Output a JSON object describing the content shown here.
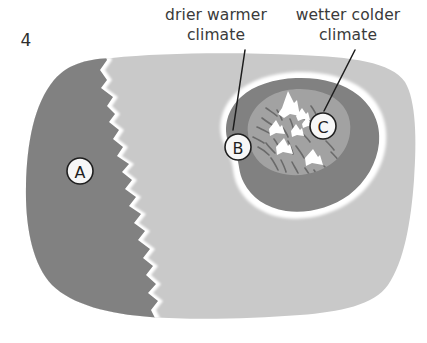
{
  "figure": {
    "number": "4",
    "title_visible": false
  },
  "callouts": [
    {
      "id": "drier-warmer",
      "line1": "drier warmer",
      "line2": "climate",
      "points_to": "B",
      "text_x": 216,
      "text_y1": 20,
      "text_y2": 40,
      "leader": {
        "x1": 245,
        "y1": 50,
        "x2": 233,
        "y2": 130
      }
    },
    {
      "id": "wetter-colder",
      "line1": "wetter colder",
      "line2": "climate",
      "points_to": "C",
      "text_x": 348,
      "text_y1": 20,
      "text_y2": 40,
      "leader": {
        "x1": 355,
        "y1": 50,
        "x2": 324,
        "y2": 111
      }
    }
  ],
  "markers": [
    {
      "id": "marker-a",
      "label": "A",
      "cx": 80,
      "cy": 171,
      "r": 13,
      "region": "lowland-dark"
    },
    {
      "id": "marker-b",
      "label": "B",
      "cx": 238,
      "cy": 147,
      "r": 13,
      "region": "upland-outer"
    },
    {
      "id": "marker-c",
      "label": "C",
      "cx": 323,
      "cy": 126,
      "r": 13,
      "region": "upland-outer"
    }
  ],
  "regions": [
    {
      "id": "landmass",
      "name": "landmass",
      "color": "#c9c9c9"
    },
    {
      "id": "lowland-dark",
      "name": "dark lowland region A",
      "color": "#818181"
    },
    {
      "id": "coast-outline",
      "name": "white coastline outline",
      "color": "#ffffff"
    },
    {
      "id": "upland-outer",
      "name": "upland outer ring",
      "color": "#818181"
    },
    {
      "id": "upland-inner",
      "name": "upland inner plateau",
      "color": "#a2a2a2"
    },
    {
      "id": "upland-halo",
      "name": "white halo around upland",
      "color": "#ffffff"
    },
    {
      "id": "mountain-peaks",
      "name": "snow capped peaks",
      "color": "#ffffff"
    },
    {
      "id": "ridge-lines",
      "name": "ridge lines",
      "color": "#6a6a6a"
    }
  ],
  "mountains": {
    "count": 7,
    "peaks": [
      {
        "cx": 288,
        "cy": 104,
        "w": 19,
        "h": 25,
        "size": "large"
      },
      {
        "cx": 302,
        "cy": 114,
        "w": 10,
        "h": 13,
        "size": "small"
      },
      {
        "cx": 306,
        "cy": 122,
        "w": 9,
        "h": 11,
        "size": "small"
      },
      {
        "cx": 276,
        "cy": 127,
        "w": 13,
        "h": 16,
        "size": "medium"
      },
      {
        "cx": 296,
        "cy": 130,
        "w": 11,
        "h": 13,
        "size": "small"
      },
      {
        "cx": 284,
        "cy": 146,
        "w": 14,
        "h": 17,
        "size": "medium"
      },
      {
        "cx": 313,
        "cy": 157,
        "w": 15,
        "h": 17,
        "size": "medium"
      }
    ]
  },
  "colors": {
    "background": "#ffffff",
    "landmass": "#c9c9c9",
    "dark_gray": "#818181",
    "mid_gray": "#a2a2a2",
    "white": "#ffffff",
    "ink": "#1c1c1c",
    "text": "#3a3a3a"
  }
}
